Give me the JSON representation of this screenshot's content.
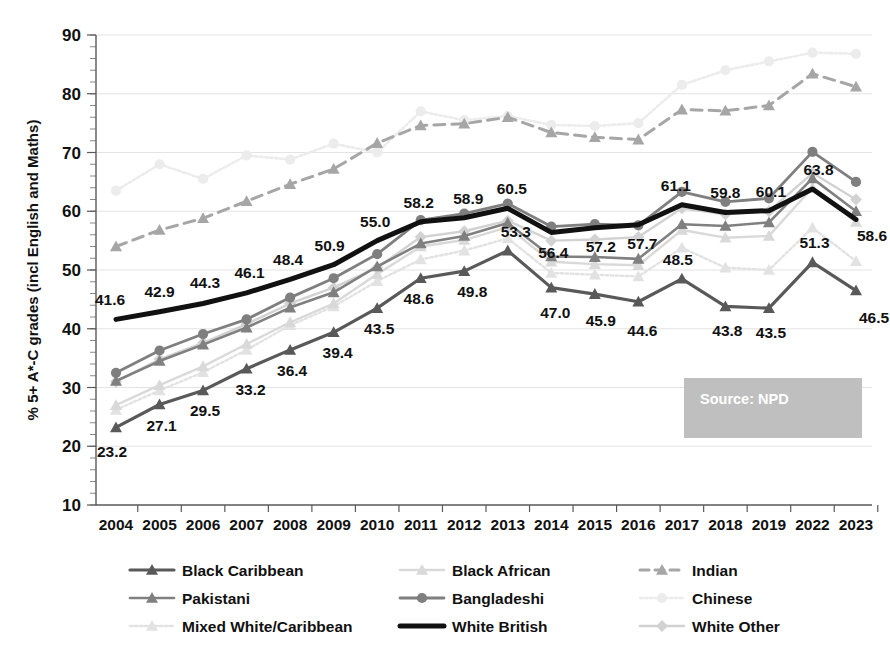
{
  "chart_data": {
    "type": "line",
    "title": "",
    "xlabel": "",
    "ylabel": "% 5+ A*-C grades (incl English and Maths)",
    "ylim": [
      10,
      90
    ],
    "ytick_step": 10,
    "yticks": [
      10,
      20,
      30,
      40,
      50,
      60,
      70,
      80,
      90
    ],
    "grid": true,
    "legend_position": "bottom",
    "minor_tick_step": 2,
    "categories": [
      "2004",
      "2005",
      "2006",
      "2007",
      "2008",
      "2009",
      "2010",
      "2011",
      "2012",
      "2013",
      "2014",
      "2015",
      "2016",
      "2017",
      "2018",
      "2019",
      "2022",
      "2023"
    ],
    "annotation": "Source: NPD",
    "series": [
      {
        "name": "Black Caribbean",
        "color": "#595959",
        "marker": "triangle",
        "dash": "solid",
        "width": 3.2,
        "labelled": true,
        "values": [
          23.2,
          27.1,
          29.5,
          33.2,
          36.4,
          39.4,
          43.5,
          48.6,
          49.8,
          53.3,
          47.0,
          45.9,
          44.6,
          48.5,
          43.8,
          43.5,
          51.3,
          46.5
        ]
      },
      {
        "name": "Black African",
        "color": "#d9d9d9",
        "marker": "triangle",
        "dash": "solid",
        "width": 2.4,
        "labelled": false,
        "values": [
          27.0,
          30.4,
          33.6,
          37.4,
          41.1,
          44.3,
          49.3,
          54.0,
          55.1,
          57.3,
          51.4,
          51.0,
          50.8,
          56.8,
          55.5,
          55.8,
          64.0,
          58.2
        ]
      },
      {
        "name": "Indian",
        "color": "#a6a6a6",
        "marker": "triangle",
        "dash": "dashed",
        "width": 3.0,
        "labelled": false,
        "values": [
          54.0,
          56.8,
          58.8,
          61.7,
          64.6,
          67.2,
          71.6,
          74.6,
          74.9,
          76.0,
          73.4,
          72.6,
          72.2,
          77.3,
          77.1,
          78.0,
          83.4,
          81.2
        ]
      },
      {
        "name": "Pakistani",
        "color": "#808080",
        "marker": "triangle",
        "dash": "solid",
        "width": 2.6,
        "labelled": false,
        "values": [
          31.1,
          34.5,
          37.3,
          40.2,
          43.6,
          46.2,
          50.6,
          54.5,
          55.8,
          58.0,
          52.3,
          52.2,
          51.9,
          57.8,
          57.5,
          58.1,
          65.6,
          60.0
        ]
      },
      {
        "name": "Bangladeshi",
        "color": "#7f7f7f",
        "marker": "circle",
        "dash": "solid",
        "width": 2.8,
        "labelled": false,
        "values": [
          32.5,
          36.3,
          39.1,
          41.6,
          45.3,
          48.6,
          52.7,
          58.5,
          59.6,
          61.3,
          57.4,
          57.8,
          57.6,
          63.3,
          61.6,
          62.2,
          70.1,
          65.0
        ]
      },
      {
        "name": "Chinese",
        "color": "#ececec",
        "marker": "circle",
        "dash": "dotted",
        "width": 2.6,
        "labelled": false,
        "values": [
          63.5,
          68.0,
          65.5,
          69.5,
          68.8,
          71.5,
          70.0,
          77.0,
          75.5,
          76.2,
          74.7,
          74.5,
          75.0,
          81.5,
          84.0,
          85.5,
          87.0,
          86.8
        ]
      },
      {
        "name": "Mixed White/Caribbean",
        "color": "#e2e2e2",
        "marker": "triangle",
        "dash": "dotted",
        "width": 2.4,
        "labelled": false,
        "values": [
          26.2,
          29.5,
          32.6,
          36.4,
          40.6,
          43.8,
          48.1,
          51.8,
          53.3,
          55.4,
          49.5,
          49.2,
          48.9,
          53.8,
          50.4,
          50.0,
          57.2,
          51.5
        ]
      },
      {
        "name": "White British",
        "color": "#111111",
        "marker": "none",
        "dash": "solid",
        "width": 5.0,
        "labelled": true,
        "values": [
          41.6,
          42.9,
          44.3,
          46.1,
          48.4,
          50.9,
          55.0,
          58.2,
          58.9,
          60.5,
          56.4,
          57.2,
          57.7,
          61.1,
          59.8,
          60.1,
          63.8,
          58.6
        ]
      },
      {
        "name": "White Other",
        "color": "#d2d2d2",
        "marker": "diamond",
        "dash": "solid",
        "width": 2.4,
        "labelled": false,
        "values": [
          31.0,
          34.8,
          37.6,
          40.8,
          44.3,
          47.0,
          50.4,
          55.6,
          56.6,
          58.4,
          55.0,
          55.2,
          55.6,
          60.5,
          59.5,
          60.0,
          66.5,
          62.0
        ]
      }
    ],
    "labelled_series": {
      "white_british": [
        41.6,
        42.9,
        44.3,
        46.1,
        48.4,
        50.9,
        55.0,
        58.2,
        58.9,
        60.5,
        56.4,
        57.2,
        57.7,
        61.1,
        59.8,
        60.1,
        63.8,
        58.6
      ],
      "black_caribbean": [
        23.2,
        27.1,
        29.5,
        33.2,
        36.4,
        39.4,
        43.5,
        48.6,
        49.8,
        53.3,
        47.0,
        45.9,
        44.6,
        48.5,
        43.8,
        43.5,
        51.3,
        46.5
      ]
    }
  },
  "legend": {
    "items": [
      {
        "label": "Black Caribbean"
      },
      {
        "label": "Black African"
      },
      {
        "label": "Indian"
      },
      {
        "label": "Pakistani"
      },
      {
        "label": "Bangladeshi"
      },
      {
        "label": "Chinese"
      },
      {
        "label": "Mixed White/Caribbean"
      },
      {
        "label": "White British"
      },
      {
        "label": "White Other"
      }
    ]
  },
  "source_box": {
    "text": "Source: NPD",
    "background": "#bfbfbf",
    "text_color": "#ffffff"
  }
}
